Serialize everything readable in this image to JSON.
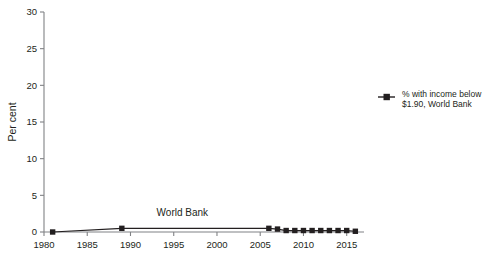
{
  "chart_data": {
    "type": "line",
    "title": "",
    "subtitle": "",
    "xlabel": "",
    "ylabel": "Per cent",
    "xlim": [
      1980,
      2017
    ],
    "ylim": [
      0,
      30
    ],
    "grid": false,
    "legend_position": "right",
    "x_ticks": [
      "1980",
      "1985",
      "1990",
      "1995",
      "2000",
      "2005",
      "2015"
    ],
    "x_tick_values": [
      1980,
      1985,
      1990,
      1995,
      2000,
      2005,
      2010,
      2015
    ],
    "x_tick_labels": [
      "1980",
      "1985",
      "1990",
      "1995",
      "2000",
      "2005",
      "2010",
      "2015"
    ],
    "y_ticks": [
      0,
      5,
      10,
      15,
      20,
      25,
      30
    ],
    "y_tick_labels": [
      "0",
      "5",
      "10",
      "15",
      "20",
      "25",
      "30"
    ],
    "series": [
      {
        "name": "% with income below $1.90, World Bank",
        "marker": "square",
        "color": "#231f20",
        "x": [
          1981,
          1989,
          2006,
          2007,
          2008,
          2009,
          2010,
          2011,
          2012,
          2013,
          2014,
          2015,
          2016
        ],
        "values": [
          0.0,
          0.5,
          0.5,
          0.4,
          0.2,
          0.2,
          0.2,
          0.2,
          0.2,
          0.2,
          0.2,
          0.2,
          0.1
        ]
      }
    ],
    "annotations": [
      {
        "text": "World Bank",
        "x": 1996,
        "y": 2.2
      }
    ],
    "legend": [
      {
        "label_line1": "% with income below",
        "label_line2": "$1.90, World Bank",
        "color": "#231f20",
        "marker": "square"
      }
    ]
  },
  "axis": {
    "y_axis_label": "Per cent"
  },
  "colors": {
    "series": "#231f20",
    "axis": "#808285",
    "text": "#231f20",
    "background": "#ffffff"
  }
}
